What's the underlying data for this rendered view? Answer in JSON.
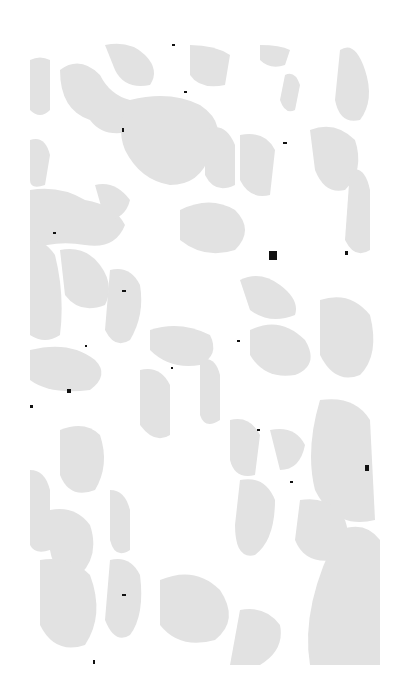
{
  "image": {
    "description": "Grayscale halftone texture of irregular light-gray blobs on white background with scattered dark specks",
    "background": "#ffffff",
    "blob_color": "#e2e2e2",
    "speck_color": "#111111",
    "bounds": {
      "x": 30,
      "y": 40,
      "width": 350,
      "height": 625
    }
  }
}
